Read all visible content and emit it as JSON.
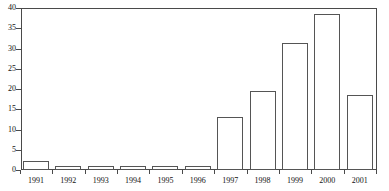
{
  "chart_data": {
    "type": "bar",
    "title": "",
    "subtitle": "",
    "xlabel": "",
    "ylabel": "",
    "categories": [
      "1991",
      "1992",
      "1993",
      "1994",
      "1995",
      "1996",
      "1997",
      "1998",
      "1999",
      "2000",
      "2001"
    ],
    "values": [
      2.2,
      1.0,
      1.0,
      1.0,
      1.0,
      1.0,
      13.2,
      19.5,
      31.3,
      38.5,
      18.5
    ],
    "series": [
      {
        "name": "",
        "values": [
          2.2,
          1.0,
          1.0,
          1.0,
          1.0,
          1.0,
          13.2,
          19.5,
          31.3,
          38.5,
          18.5
        ]
      }
    ],
    "ylim": [
      0,
      40
    ],
    "ytick_values": [
      0,
      5,
      10,
      15,
      20,
      25,
      30,
      35,
      40
    ],
    "ytick_labels": [
      "0",
      "5",
      "10",
      "15",
      "20",
      "25",
      "30",
      "35",
      "40"
    ],
    "xtick_labels": [
      "1991",
      "1992",
      "1993",
      "1994",
      "1995",
      "1996",
      "1997",
      "1998",
      "1999",
      "2000",
      "2001"
    ],
    "grid": false,
    "legend": false,
    "legend_position": "none",
    "bar_fill_color": "#ffffff",
    "bar_edge_color": "#555555",
    "axis_color": "#4a4a4a",
    "text_color": "#111111",
    "background_color": "#ffffff",
    "annotations": []
  }
}
